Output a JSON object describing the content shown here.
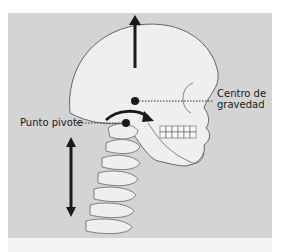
{
  "figure": {
    "labels": {
      "center_of_gravity_line1": "Centro de",
      "center_of_gravity_line2": "gravedad",
      "pivot_point": "Punto pivote"
    },
    "colors": {
      "background_panel": "#d4d4d4",
      "bone_fill": "#efefef",
      "outline": "#555555",
      "arrow": "#1a1a1a"
    },
    "arrows": [
      {
        "name": "upward-force-arrow",
        "direction": "up"
      },
      {
        "name": "rotation-arrow",
        "direction": "clockwise"
      },
      {
        "name": "vertical-double-arrow",
        "direction": "up-down"
      }
    ]
  }
}
